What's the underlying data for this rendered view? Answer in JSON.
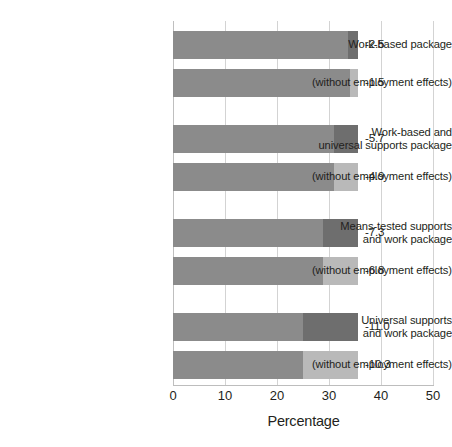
{
  "chart_data": {
    "type": "bar",
    "orientation": "horizontal",
    "title": "",
    "subtitle": "",
    "xlabel": "Percentage",
    "ylabel": "",
    "xlim": [
      0,
      50
    ],
    "xticks": [
      0,
      10,
      20,
      30,
      40,
      50
    ],
    "xtick_labels": [
      "0",
      "10",
      "20",
      "30",
      "40",
      "50"
    ],
    "grid": true,
    "grid_axis": "x",
    "legend": false,
    "legend_position": "none",
    "stacked": true,
    "colors": {
      "base_segment": "#8b8b8b",
      "dark_segment": "#6e6e6e",
      "light_segment": "#b9b9b9",
      "gridline": "#d3d3d3",
      "axis": "#bdbdbd",
      "text": "#231f20",
      "background": "#ffffff"
    },
    "series": [
      {
        "name": "base",
        "color_key": "base_segment"
      },
      {
        "name": "remainder",
        "color_key": "varies"
      }
    ],
    "groups": [
      {
        "label_lines": [
          "Work-based package"
        ],
        "bars": [
          {
            "label_lines": [
              "Work-based package"
            ],
            "value_label": "-2.5",
            "total": 35.6,
            "base": 33.6,
            "remainder": 2.0,
            "remainder_shade": "dark"
          },
          {
            "label_lines": [
              "(without employment effects)"
            ],
            "value_label": "-1.5",
            "total": 35.6,
            "base": 34.0,
            "remainder": 1.6,
            "remainder_shade": "light"
          }
        ]
      },
      {
        "label_lines": [
          "Work-based and",
          "universal supports package"
        ],
        "bars": [
          {
            "label_lines": [
              "Work-based and",
              "universal supports package"
            ],
            "value_label": "-5.7",
            "total": 35.6,
            "base": 31.0,
            "remainder": 4.6,
            "remainder_shade": "dark"
          },
          {
            "label_lines": [
              "(without employment effects)"
            ],
            "value_label": "-4.9",
            "total": 35.6,
            "base": 31.0,
            "remainder": 4.6,
            "remainder_shade": "light"
          }
        ]
      },
      {
        "label_lines": [
          "Means-tested supports",
          "and work package"
        ],
        "bars": [
          {
            "label_lines": [
              "Means-tested supports",
              "and work package"
            ],
            "value_label": "-7.3",
            "total": 35.6,
            "base": 28.8,
            "remainder": 6.8,
            "remainder_shade": "dark"
          },
          {
            "label_lines": [
              "(without employment effects)"
            ],
            "value_label": "-6.8",
            "total": 35.6,
            "base": 28.8,
            "remainder": 6.8,
            "remainder_shade": "light"
          }
        ]
      },
      {
        "label_lines": [
          "Universal supports",
          "and work package"
        ],
        "bars": [
          {
            "label_lines": [
              "Universal supports",
              "and work package"
            ],
            "value_label": "-11.0",
            "total": 35.6,
            "base": 25.0,
            "remainder": 10.6,
            "remainder_shade": "dark"
          },
          {
            "label_lines": [
              "(without employment effects)"
            ],
            "value_label": "-10.3",
            "total": 35.6,
            "base": 25.0,
            "remainder": 10.6,
            "remainder_shade": "light"
          }
        ]
      }
    ],
    "categories": [
      "Work-based package",
      "(without employment effects)",
      "Work-based and universal supports package",
      "(without employment effects)",
      "Means-tested supports and work package",
      "(without employment effects)",
      "Universal supports and work package",
      "(without employment effects)"
    ],
    "values": [
      -2.5,
      -1.5,
      -5.7,
      -4.9,
      -7.3,
      -6.8,
      -11.0,
      -10.3
    ]
  }
}
